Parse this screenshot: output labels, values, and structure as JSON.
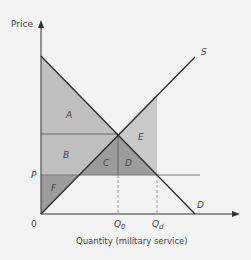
{
  "diagram": {
    "y_axis_label": "Price",
    "x_axis_label": "Quantity (military service)",
    "origin_label": "0",
    "price_label": "P",
    "supply_label": "S",
    "demand_label": "D",
    "q0_label": "Q",
    "q0_sub": "0",
    "qd_label": "Q",
    "qd_sub": "d",
    "regions": {
      "A": "A",
      "B": "B",
      "C": "C",
      "D": "D",
      "E": "E",
      "F": "F"
    },
    "colors": {
      "background": "#f3f3f3",
      "light_region": "#bfbfbf",
      "dark_region": "#9c9c9c",
      "lighter_region": "#c9c9c9",
      "line": "#2a2a2a",
      "guide": "#7a7a7a"
    }
  }
}
